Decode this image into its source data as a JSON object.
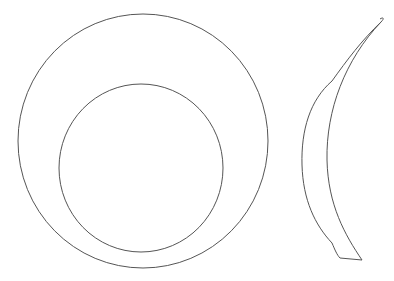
{
  "figure": {
    "stroke_color": "#555555",
    "background": "#ffffff",
    "views": [
      {
        "name": "plan-view",
        "outer_circle": {
          "cx": 143,
          "cy": 141,
          "rx": 125,
          "ry": 127
        },
        "inner_circle": {
          "cx": 141,
          "cy": 168,
          "rx": 82,
          "ry": 84
        }
      },
      {
        "name": "profile-view",
        "shape": "crescent"
      }
    ]
  }
}
